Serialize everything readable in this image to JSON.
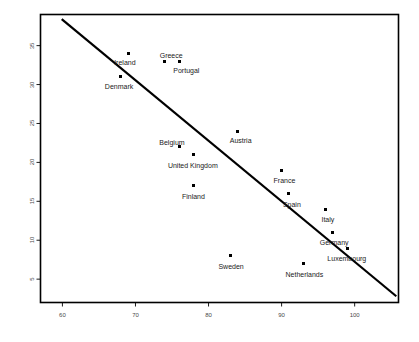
{
  "chart_data": {
    "type": "scatter",
    "title": "",
    "xlabel": "",
    "ylabel": "",
    "xlim": [
      57,
      106
    ],
    "ylim": [
      2,
      39
    ],
    "xticks": [
      60,
      70,
      80,
      90,
      100
    ],
    "yticks": [
      5,
      10,
      15,
      20,
      25,
      30,
      35
    ],
    "grid": false,
    "legend": "none",
    "points": [
      {
        "label": "Ireland",
        "x": 69,
        "y": 34,
        "label_dx": -14,
        "label_dy": 6
      },
      {
        "label": "Denmark",
        "x": 68,
        "y": 31,
        "label_dx": -16,
        "label_dy": 6
      },
      {
        "label": "Greece",
        "x": 74,
        "y": 33,
        "label_dx": -5,
        "label_dy": -9
      },
      {
        "label": "Portugal",
        "x": 76,
        "y": 33,
        "label_dx": -6,
        "label_dy": 6
      },
      {
        "label": "Austria",
        "x": 84,
        "y": 24,
        "label_dx": -8,
        "label_dy": 6
      },
      {
        "label": "Belgium",
        "x": 76,
        "y": 22,
        "label_dx": -20,
        "label_dy": -8
      },
      {
        "label": "United Kingdom",
        "x": 78,
        "y": 21,
        "label_dx": -26,
        "label_dy": 7
      },
      {
        "label": "Finland",
        "x": 78,
        "y": 17,
        "label_dx": -12,
        "label_dy": 7
      },
      {
        "label": "France",
        "x": 90,
        "y": 19,
        "label_dx": -8,
        "label_dy": 7
      },
      {
        "label": "Spain",
        "x": 91,
        "y": 16,
        "label_dx": -6,
        "label_dy": 7
      },
      {
        "label": "Italy",
        "x": 96,
        "y": 14,
        "label_dx": -4,
        "label_dy": 7
      },
      {
        "label": "Germany",
        "x": 97,
        "y": 11,
        "label_dx": -13,
        "label_dy": 7
      },
      {
        "label": "Sweden",
        "x": 83,
        "y": 8,
        "label_dx": -12,
        "label_dy": 7
      },
      {
        "label": "Netherlands",
        "x": 93,
        "y": 7,
        "label_dx": -18,
        "label_dy": 7
      },
      {
        "label": "Luxembourg",
        "x": 99,
        "y": 9,
        "label_dx": -20,
        "label_dy": 7
      }
    ],
    "trendline": {
      "name": "fitted-regression-line",
      "x_start": 59.9,
      "y_start": 38.4,
      "x_end": 105.7,
      "y_end": 2.8
    },
    "colors": {
      "axis": "#000000",
      "marker": "#000000",
      "trendline": "#000000",
      "tick_text": "#4a4a4a",
      "point_text": "#1a1a1a",
      "background": "#ffffff"
    }
  }
}
